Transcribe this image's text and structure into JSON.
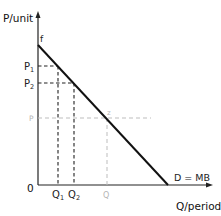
{
  "diagram": {
    "type": "demand-curve",
    "axes": {
      "y_label": "P/unit",
      "x_label": "Q/period",
      "origin_label": "0"
    },
    "curve": {
      "label": "D = MB",
      "intercept_label": "f",
      "point_label": "z",
      "color": "#111111"
    },
    "price_levels": [
      {
        "label": "P",
        "sub": "1",
        "color": "#222222"
      },
      {
        "label": "P",
        "sub": "2",
        "color": "#222222"
      },
      {
        "label": "P",
        "sub": "",
        "color": "#b5b5b5"
      }
    ],
    "quantity_levels": [
      {
        "label": "Q",
        "sub": "1",
        "color": "#222222"
      },
      {
        "label": "Q",
        "sub": "2",
        "color": "#222222"
      },
      {
        "label": "Q",
        "sub": "",
        "color": "#b5b5b5"
      }
    ]
  }
}
